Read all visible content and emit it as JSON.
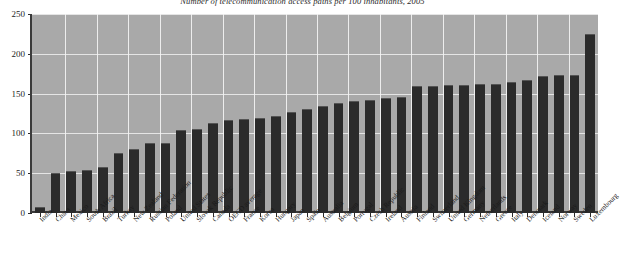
{
  "chart_data": {
    "type": "bar",
    "title": "Number of telecommunication access paths per 100 inhabitants, 2005",
    "xlabel": "",
    "ylabel": "",
    "ylim": [
      0,
      250
    ],
    "ytick_values": [
      0,
      50,
      100,
      150,
      200,
      250
    ],
    "grid": true,
    "legend": "none",
    "bar_color": "#2b2b2b",
    "plot_background": "#a9a9a9",
    "gridline_color": "#f0f0f0",
    "categories": [
      "India",
      "China",
      "Mexico",
      "South Africa",
      "Brazil",
      "Turkey",
      "New Zealand",
      "Russian Federation",
      "Poland",
      "United States",
      "Slovak Republic",
      "Canada",
      "OECD average",
      "France",
      "Korea",
      "Hungary",
      "Japan",
      "Spain",
      "Australia",
      "Belgium",
      "Portugal",
      "Czech Republic",
      "Ireland",
      "Austria",
      "Finland",
      "Switzerland",
      "United Kingdom",
      "Germany",
      "Netherlands",
      "Greece",
      "Italy",
      "Denmark",
      "Iceland",
      "Norway",
      "Sweden",
      "Luxembourg"
    ],
    "values": [
      8,
      50,
      53,
      54,
      58,
      75,
      80,
      88,
      88,
      104,
      105,
      113,
      117,
      118,
      119,
      122,
      127,
      131,
      135,
      138,
      141,
      142,
      145,
      146,
      159,
      160,
      161,
      161,
      162,
      162,
      165,
      167,
      172,
      174,
      174,
      225
    ]
  }
}
